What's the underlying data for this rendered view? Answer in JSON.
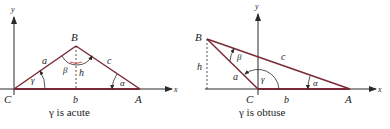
{
  "colors": {
    "ink": "#2a2a2a",
    "side": "#7a2a36",
    "arc_accent": "#d23b3b",
    "background": "#ffffff"
  },
  "left_figure": {
    "caption": "γ is acute",
    "axis_x_label": "x",
    "axis_y_label": "y",
    "vertices": {
      "C": "C",
      "B": "B",
      "A": "A"
    },
    "sides": {
      "a": "a",
      "b": "b",
      "c": "c"
    },
    "angles": {
      "alpha": "α",
      "beta": "β",
      "gamma": "γ"
    },
    "height_label": "h"
  },
  "right_figure": {
    "caption": "γ is obtuse",
    "axis_x_label": "x",
    "axis_y_label": "y",
    "vertices": {
      "C": "C",
      "B": "B",
      "A": "A"
    },
    "sides": {
      "a": "a",
      "b": "b",
      "c": "c"
    },
    "angles": {
      "alpha": "α",
      "beta": "β",
      "gamma": "γ"
    },
    "height_label": "h"
  }
}
